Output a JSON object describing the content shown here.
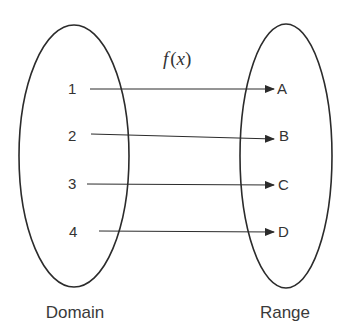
{
  "function_label": {
    "f": "f",
    "open": "(",
    "x": "x",
    "close": ")"
  },
  "domain": {
    "label": "Domain",
    "elements": [
      "1",
      "2",
      "3",
      "4"
    ]
  },
  "range": {
    "label": "Range",
    "elements": [
      "A",
      "B",
      "C",
      "D"
    ]
  },
  "mappings": [
    {
      "from": "1",
      "to": "A"
    },
    {
      "from": "2",
      "to": "B"
    },
    {
      "from": "3",
      "to": "C"
    },
    {
      "from": "4",
      "to": "D"
    }
  ],
  "colors": {
    "stroke": "#2b2b2b",
    "text": "#333333",
    "background": "#ffffff"
  }
}
